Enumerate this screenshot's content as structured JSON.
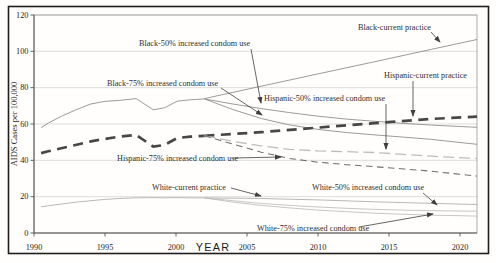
{
  "figure": {
    "ylabel": "AIDS Cases per 100,000",
    "xlabel": "YEAR"
  },
  "chart_data": {
    "type": "line",
    "title": "",
    "xlabel": "YEAR",
    "ylabel": "AIDS Cases per 100,000",
    "xlim": [
      1990,
      2021.5
    ],
    "ylim": [
      0,
      120
    ],
    "x_ticks": [
      "1990",
      "1995",
      "2000",
      "2005",
      "2010",
      "2015",
      "2020"
    ],
    "x_tick_years": [
      1990,
      1995,
      2000,
      2005,
      2010,
      2015,
      2020
    ],
    "y_ticks": [
      "0",
      "20",
      "40",
      "60",
      "80",
      "100",
      "120"
    ],
    "y_tick_values": [
      0,
      20,
      40,
      60,
      80,
      100,
      120
    ],
    "grid": "horizontal gridlines at every 20 units",
    "legend": "none - series labeled by on-plot annotations with leader arrows",
    "series": [
      {
        "key": "black_hist",
        "name": "Black (1990-2002, shared by all scenarios)",
        "x": [
          1990.5,
          1991,
          1992,
          1993,
          1994,
          1995,
          1996,
          1997.2,
          1998.4,
          1999.2,
          2000.1,
          2001,
          2002
        ],
        "values": [
          58,
          60.5,
          64.5,
          68,
          71,
          72.5,
          73,
          74,
          67.8,
          69,
          72.6,
          73.3,
          73.8
        ],
        "stroke": "#8f8f8f",
        "width": 0.9,
        "dash": ""
      },
      {
        "key": "black_current",
        "name": "Black-current practice",
        "x": [
          2002,
          2006,
          2010,
          2014,
          2018,
          2021.2
        ],
        "values": [
          74,
          80.8,
          87.6,
          94.3,
          101.1,
          106.5
        ],
        "stroke": "#8f8f8f",
        "width": 0.9,
        "dash": ""
      },
      {
        "key": "black_50",
        "name": "Black-50% increased condom use",
        "x": [
          2002,
          2004,
          2006,
          2008,
          2010,
          2012,
          2014,
          2016,
          2018,
          2020,
          2021.2
        ],
        "values": [
          73.8,
          71,
          68.5,
          66.3,
          64.3,
          62.7,
          61.5,
          60.4,
          59.4,
          58.6,
          58.2
        ],
        "stroke": "#8f8f8f",
        "width": 0.9,
        "dash": ""
      },
      {
        "key": "black_75",
        "name": "Black-75% increased condom use",
        "x": [
          2002,
          2004,
          2006,
          2008,
          2010,
          2012,
          2014,
          2016,
          2018,
          2020,
          2021.2
        ],
        "values": [
          73.8,
          68,
          63,
          59.5,
          57,
          55.3,
          54,
          52.8,
          51.5,
          49.8,
          48.8
        ],
        "stroke": "#8f8f8f",
        "width": 0.9,
        "dash": ""
      },
      {
        "key": "hispanic_hist",
        "name": "Hispanic (1990-2002, shared by all scenarios)",
        "x": [
          1990.5,
          1991,
          1992,
          1993,
          1994,
          1995,
          1996,
          1997.2,
          1998.4,
          1999.2,
          2000.1,
          2001,
          2002
        ],
        "values": [
          44,
          45,
          46.8,
          48.6,
          50.4,
          51.8,
          53,
          54,
          47.5,
          48.5,
          52.3,
          53,
          53.5
        ],
        "stroke": "#474747",
        "width": 2.7,
        "dash": "10 6.5"
      },
      {
        "key": "hispanic_current",
        "name": "Hispanic-current practice",
        "x": [
          2002,
          2006,
          2010,
          2014,
          2018,
          2021.2
        ],
        "values": [
          53.5,
          55.5,
          58,
          60.5,
          62.8,
          64
        ],
        "stroke": "#474747",
        "width": 2.7,
        "dash": "10 6.5"
      },
      {
        "key": "hispanic_50",
        "name": "Hispanic-50% increased condom use",
        "x": [
          2002,
          2004,
          2006,
          2008,
          2010,
          2014,
          2018,
          2021.2
        ],
        "values": [
          53.5,
          50.5,
          48,
          46,
          45.2,
          44.3,
          42.3,
          41
        ],
        "stroke": "#bdbdbd",
        "width": 1.3,
        "dash": "11 5"
      },
      {
        "key": "hispanic_75",
        "name": "Hispanic-75% increased condom use",
        "x": [
          2002,
          2004,
          2006,
          2008,
          2010,
          2012,
          2014,
          2016,
          2018,
          2020,
          2021.2
        ],
        "values": [
          53.5,
          49,
          44.5,
          41,
          39,
          37.6,
          36.5,
          35.3,
          34,
          32.3,
          31.3
        ],
        "stroke": "#6e6e6e",
        "width": 1.05,
        "dash": "6.5 4.5"
      },
      {
        "key": "white_hist",
        "name": "White (1990-2002, shared by all scenarios)",
        "x": [
          1990.5,
          1991,
          1992,
          1993,
          1994,
          1995,
          1996,
          1997,
          1998,
          1999,
          2000,
          2001,
          2002
        ],
        "values": [
          14.4,
          15,
          16,
          17,
          17.8,
          18.5,
          19,
          19.3,
          19.5,
          19.4,
          19.5,
          19.4,
          19.3
        ],
        "stroke": "#b0b0b0",
        "width": 0.9,
        "dash": ""
      },
      {
        "key": "white_current",
        "name": "White-current practice",
        "x": [
          2002,
          2006,
          2010,
          2014,
          2018,
          2021.2
        ],
        "values": [
          19.3,
          19,
          18.2,
          17.2,
          16.3,
          15.7
        ],
        "stroke": "#b0b0b0",
        "width": 0.9,
        "dash": ""
      },
      {
        "key": "white_50",
        "name": "White-50% increased condom use",
        "x": [
          2002,
          2004,
          2006,
          2008,
          2010,
          2012,
          2014,
          2016,
          2018,
          2020,
          2021.2
        ],
        "values": [
          19.3,
          17.8,
          16.3,
          15.2,
          14.3,
          13.6,
          13,
          12.6,
          12.3,
          12.1,
          12
        ],
        "stroke": "#b7b7b7",
        "width": 0.8,
        "dash": ""
      },
      {
        "key": "white_75",
        "name": "White-75% increased condom use",
        "x": [
          2002,
          2004,
          2006,
          2008,
          2010,
          2012,
          2014,
          2016,
          2018,
          2020,
          2021.2
        ],
        "values": [
          19.3,
          17,
          15.2,
          13.8,
          12.6,
          11.7,
          10.9,
          10.3,
          9.8,
          9.5,
          9.3
        ],
        "stroke": "#b7b7b7",
        "width": 0.8,
        "dash": ""
      }
    ],
    "annotations": [
      {
        "key": "black_current",
        "text": "Black-current practice",
        "tx": 358,
        "ty": 30,
        "ax1": 431,
        "ay1": 32,
        "ax2": 440,
        "ay2": 42
      },
      {
        "key": "black_50",
        "text": "Black-50% increased condom use",
        "tx": 139,
        "ty": 46,
        "ax1": 251,
        "ay1": 49,
        "ax2": 261,
        "ay2": 103
      },
      {
        "key": "black_75",
        "text": "Black-75% increased condom use",
        "tx": 107,
        "ty": 86,
        "ax1": 221,
        "ay1": 88,
        "ax2": 262,
        "ay2": 115
      },
      {
        "key": "hispanic_current",
        "text": "Hispanic-current practice",
        "tx": 384,
        "ty": 78,
        "ax1": 413,
        "ay1": 81,
        "ax2": 413,
        "ay2": 116
      },
      {
        "key": "hispanic_50",
        "text": "Hispanic-50% increased condom use",
        "tx": 264,
        "ty": 101,
        "ax1": 386,
        "ay1": 104,
        "ax2": 386,
        "ay2": 149
      },
      {
        "key": "hispanic_75",
        "text": "Hispanic-75% increased condom use",
        "tx": 117,
        "ty": 161,
        "ax1": 233,
        "ay1": 158,
        "ax2": 281,
        "ay2": 157
      },
      {
        "key": "white_current",
        "text": "White-current practice",
        "tx": 152,
        "ty": 190,
        "ax1": 231,
        "ay1": 188,
        "ax2": 261,
        "ay2": 196
      },
      {
        "key": "white_50",
        "text": "White-50% increased condom use",
        "tx": 312,
        "ty": 190,
        "ax1": 423,
        "ay1": 193,
        "ax2": 437,
        "ay2": 205
      },
      {
        "key": "white_75",
        "text": "White-75% increased condom use",
        "tx": 257,
        "ty": 231,
        "ax1": 359,
        "ay1": 227,
        "ax2": 433,
        "ay2": 214
      }
    ],
    "colors": {
      "ink": "#2f2f2f",
      "axis": "#555555",
      "gridline": "#cfcfcf",
      "plot_border": "#9a9a9a",
      "arrow": "#3f3f3f",
      "outer_border": "#1f1f1f"
    },
    "plot_px": {
      "left": 34,
      "right": 477,
      "top": 15,
      "bottom": 233,
      "x0_year": 1990,
      "x1_year": 2021.2
    }
  }
}
